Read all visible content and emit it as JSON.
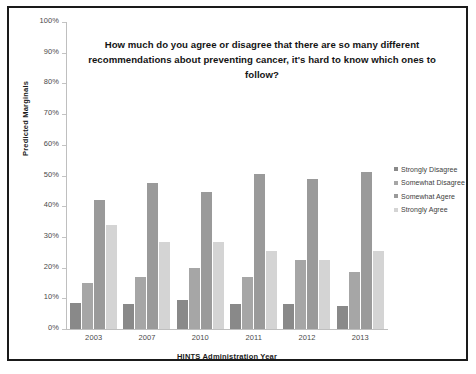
{
  "chart_data": {
    "type": "bar",
    "title": "How much do you agree or disagree that there are so many different recommendations about preventing cancer, it's hard to know which ones to follow?",
    "xlabel": "HINTS Administration Year",
    "ylabel": "Predicted Marginals",
    "categories": [
      "2003",
      "2007",
      "2010",
      "2011",
      "2012",
      "2013"
    ],
    "ylim": [
      0,
      100
    ],
    "ytick_labels": [
      "100%",
      "90%",
      "80%",
      "70%",
      "60%",
      "50%",
      "40%",
      "30%",
      "20%",
      "10%",
      "0%"
    ],
    "ytick_values": [
      100,
      90,
      80,
      70,
      60,
      50,
      40,
      30,
      20,
      10,
      0
    ],
    "grid": false,
    "legend_position": "right",
    "series": [
      {
        "name": "Strongly Disagree",
        "color": "#898989",
        "values": [
          8.5,
          8.0,
          9.5,
          8.0,
          8.0,
          7.5
        ]
      },
      {
        "name": "Somewhat Disagree",
        "color": "#a6a6a6",
        "values": [
          15.0,
          17.0,
          20.0,
          17.0,
          22.5,
          18.5
        ]
      },
      {
        "name": "Somewhat Agere",
        "color": "#9a9a9a",
        "values": [
          42.0,
          47.5,
          44.5,
          50.5,
          49.0,
          51.0
        ]
      },
      {
        "name": "Strongly Agree",
        "color": "#d4d4d4",
        "values": [
          34.0,
          28.5,
          28.5,
          25.5,
          22.5,
          25.5
        ]
      }
    ]
  }
}
